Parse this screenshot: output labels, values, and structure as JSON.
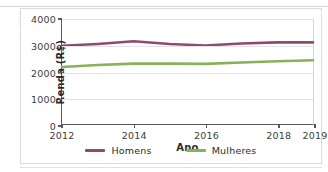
{
  "credit": {
    "text": "Adilson Secco/ID/BR"
  },
  "cut_title": {
    "text": ""
  },
  "chart_data": {
    "type": "line",
    "title": "",
    "xlabel": "Ano",
    "ylabel": "Renda (R$)",
    "x": [
      2012,
      2013,
      2014,
      2015,
      2016,
      2017,
      2018,
      2019
    ],
    "xtick_labels": [
      "2012",
      "2014",
      "2016",
      "2018",
      "2019"
    ],
    "xtick_values": [
      2012,
      2014,
      2016,
      2018,
      2019
    ],
    "ytick_labels": [
      "0",
      "1000",
      "2000",
      "3000",
      "4000"
    ],
    "ytick_values": [
      0,
      1000,
      2000,
      3000,
      4000
    ],
    "xlim": [
      2012,
      2019
    ],
    "ylim": [
      0,
      4000
    ],
    "grid": true,
    "legend_position": "bottom",
    "series": [
      {
        "name": "Homens",
        "color": "#8e4a72",
        "values": [
          2980,
          3050,
          3150,
          3050,
          2990,
          3070,
          3110,
          3110
        ]
      },
      {
        "name": "Mulheres",
        "color": "#8ab05a",
        "values": [
          2170,
          2250,
          2300,
          2300,
          2290,
          2340,
          2390,
          2430
        ]
      }
    ]
  }
}
